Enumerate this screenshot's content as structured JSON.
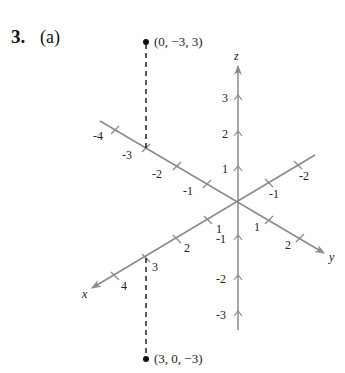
{
  "header": {
    "problem_number": "3.",
    "part": "(a)"
  },
  "colors": {
    "axis": "#8a8a8a",
    "ink": "#111111",
    "background": "#ffffff"
  },
  "axes": {
    "x": {
      "label": "x",
      "ticks": [
        "-2",
        "-1",
        "1",
        "2",
        "3",
        "4"
      ]
    },
    "y": {
      "label": "y",
      "ticks": [
        "-4",
        "-3",
        "-2",
        "-1",
        "1",
        "2"
      ]
    },
    "z": {
      "label": "z",
      "ticks": [
        "3",
        "2",
        "1",
        "-1",
        "-2",
        "-3"
      ]
    }
  },
  "points": [
    {
      "coords": [
        0,
        -3,
        3
      ],
      "label": "(0, −3, 3)"
    },
    {
      "coords": [
        3,
        0,
        -3
      ],
      "label": "(3, 0, −3)"
    }
  ]
}
